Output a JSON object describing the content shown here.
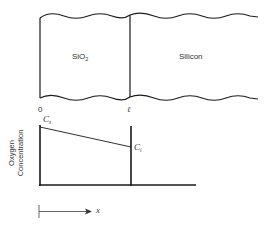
{
  "diagram": {
    "regions": [
      {
        "name": "SiO2",
        "label": "SiO",
        "subscript": "2"
      },
      {
        "name": "Silicon",
        "label": "Silicon"
      }
    ],
    "positions": {
      "origin": "0",
      "interface": "ℓ"
    },
    "graph": {
      "ylabel_line1": "Oxygen",
      "ylabel_line2": "Concentration",
      "cs_label": "C",
      "cs_sub": "s",
      "ci_label": "C",
      "ci_sub": "i"
    },
    "axis_arrow": {
      "label": "x"
    },
    "colors": {
      "line": "#1a1a1a",
      "text": "#333333"
    }
  }
}
